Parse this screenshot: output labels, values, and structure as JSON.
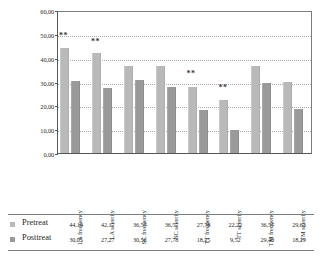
{
  "chart_data": {
    "type": "bar",
    "title": "",
    "subtitle": "",
    "xlabel": "",
    "ylabel": "",
    "ylim": [
      0,
      60
    ],
    "ytick_step": 10,
    "grid": true,
    "grid_style": "dotted-horizontal",
    "legend_position": "below-table-rows",
    "decimal_separator": ",",
    "categories": [
      "LA frequency",
      "LA severity",
      "SC frequency",
      "SC severity",
      "TT frequency",
      "TT severity",
      "TM frequency",
      "TM severity"
    ],
    "ytick_labels": [
      "60,00",
      "50,00",
      "40,00",
      "30,00",
      "20,00",
      "10,00",
      "0,00"
    ],
    "ytick_values": [
      60,
      50,
      40,
      30,
      20,
      10,
      0
    ],
    "series": [
      {
        "name": "Pretreat",
        "color": "#b9b9b9",
        "values": [
          44.19,
          42.17,
          36.57,
          36.57,
          27.78,
          22.22,
          36.57,
          29.63
        ],
        "labels": [
          "44,19",
          "42,17",
          "36,57",
          "36,57",
          "27,78",
          "22,22",
          "36,57",
          "29,63"
        ]
      },
      {
        "name": "Posttreat",
        "color": "#9a9a9a",
        "values": [
          30.05,
          27.27,
          30.56,
          27.78,
          18.25,
          9.52,
          29.4,
          18.29
        ],
        "labels": [
          "30,05",
          "27,27",
          "30,56",
          "27,78",
          "18,25",
          "9,52",
          "29,40",
          "18,29"
        ]
      }
    ],
    "annotations": [
      {
        "category": "LA frequency",
        "text": "**",
        "value": 47.5
      },
      {
        "category": "LA severity",
        "text": "**",
        "value": 45.0
      },
      {
        "category": "TT frequency",
        "text": "**",
        "value": 31.5
      },
      {
        "category": "TT severity",
        "text": "**",
        "value": 25.5
      }
    ]
  },
  "table": {
    "rows": [
      {
        "label": "Pretreat",
        "swatch": "pre",
        "values": [
          "44,19",
          "42,17",
          "36,57",
          "36,57",
          "27,78",
          "22,22",
          "36,57",
          "29,63"
        ]
      },
      {
        "label": "Posttreat",
        "swatch": "post",
        "values": [
          "30,05",
          "27,27",
          "30,56",
          "27,78",
          "18,25",
          "9,52",
          "29,40",
          "18,29"
        ]
      }
    ]
  }
}
